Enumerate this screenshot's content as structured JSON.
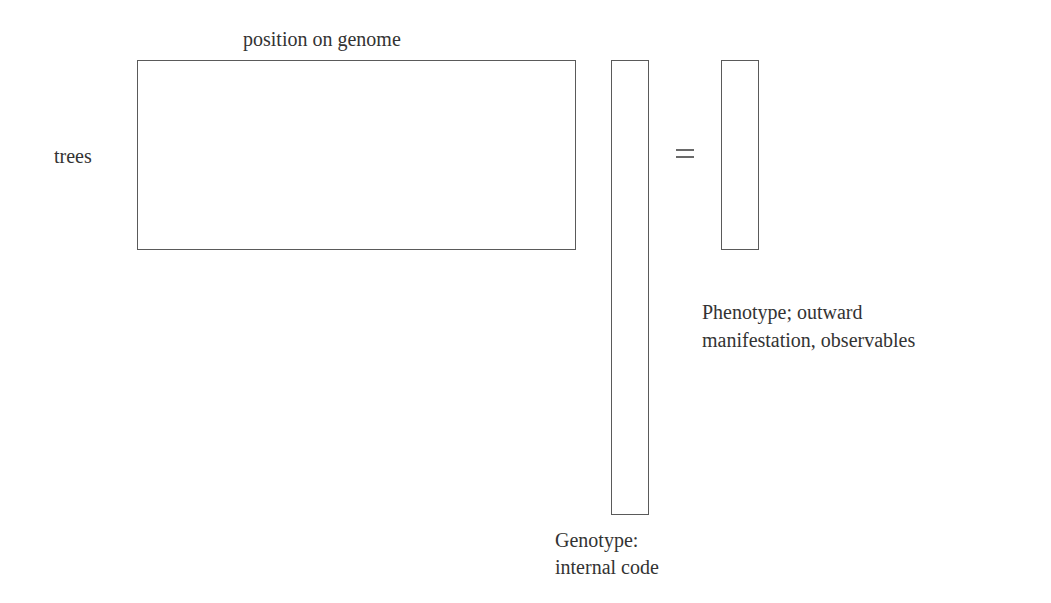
{
  "diagram": {
    "matrix": {
      "column_label": "position on genome",
      "row_label": "trees"
    },
    "operator": "=",
    "genotype": {
      "line1": "Genotype:",
      "line2": "internal code"
    },
    "phenotype": {
      "line1": "Phenotype; outward",
      "line2": "manifestation, observables"
    },
    "colors": {
      "border": "#5a5a5a",
      "text": "#333333",
      "background": "#ffffff"
    }
  }
}
